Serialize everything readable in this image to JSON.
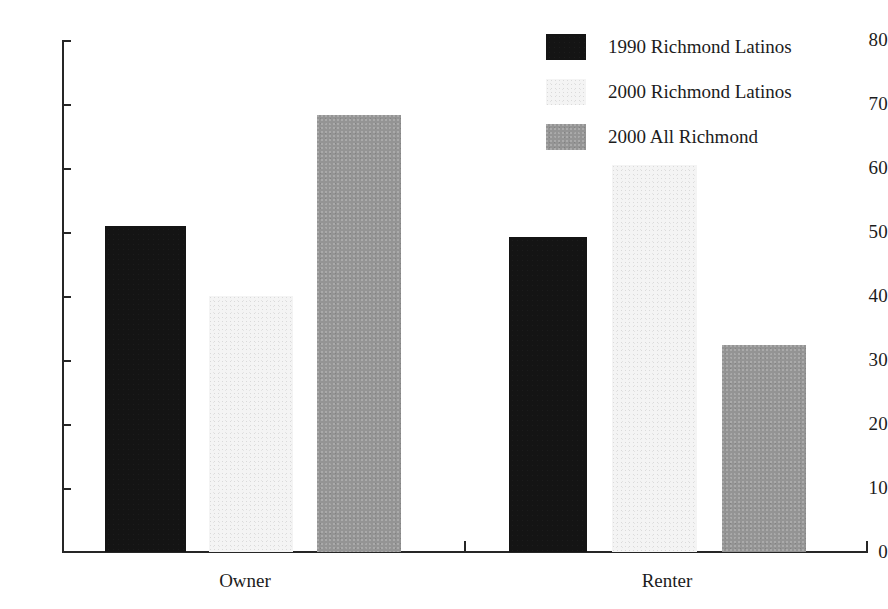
{
  "chart_data": {
    "type": "bar",
    "title": "",
    "subtitle": "",
    "xlabel": "",
    "ylabel": "",
    "categories": [
      "Owner",
      "Renter"
    ],
    "series": [
      {
        "name": "1990 Richmond Latinos",
        "color": "#141414",
        "values": [
          51.0,
          49.3
        ]
      },
      {
        "name": "2000 Richmond Latinos",
        "color": "#f4f4f4",
        "values": [
          40.0,
          60.5
        ]
      },
      {
        "name": "2000 All Richmond",
        "color": "#949494",
        "values": [
          68.3,
          32.3
        ]
      }
    ],
    "ylim": [
      0,
      80
    ],
    "ytick_labels": [
      "80",
      "70",
      "60",
      "50",
      "40",
      "30",
      "20",
      "10",
      "0"
    ],
    "ytick_values": [
      80,
      70,
      60,
      50,
      40,
      30,
      20,
      10,
      0
    ],
    "grid": false,
    "legend_position": "top-right",
    "annotations": []
  },
  "legend": {
    "entries": [
      {
        "label": "1990 Richmond Latinos",
        "swatch": "dark"
      },
      {
        "label": "2000 Richmond Latinos",
        "swatch": "light"
      },
      {
        "label": "2000 All Richmond",
        "swatch": "gray"
      }
    ]
  },
  "axis": {
    "y_ticks": [
      {
        "label": "80",
        "value": 80
      },
      {
        "label": "70",
        "value": 70
      },
      {
        "label": "60",
        "value": 60
      },
      {
        "label": "50",
        "value": 50
      },
      {
        "label": "40",
        "value": 40
      },
      {
        "label": "30",
        "value": 30
      },
      {
        "label": "20",
        "value": 20
      },
      {
        "label": "10",
        "value": 10
      },
      {
        "label": "0",
        "value": 0
      }
    ],
    "x_categories": [
      {
        "label": "Owner"
      },
      {
        "label": "Renter"
      }
    ]
  }
}
